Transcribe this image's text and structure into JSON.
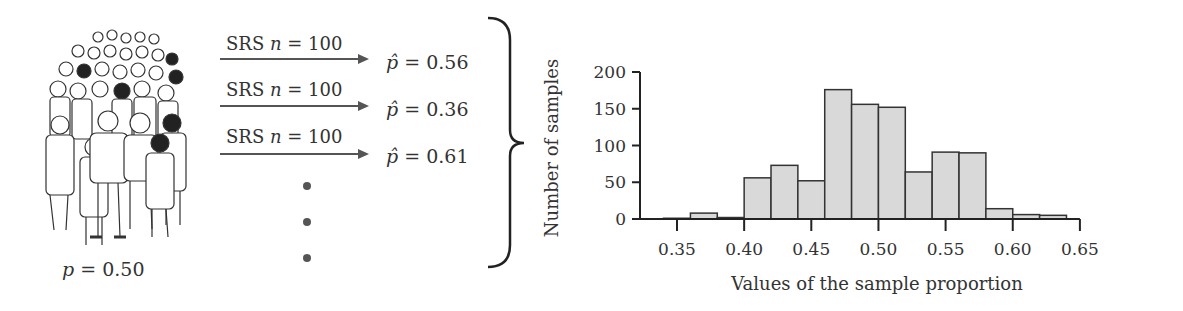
{
  "population": {
    "illustration": "crowd-of-people",
    "label_symbol": "p",
    "label_value": "= 0.50"
  },
  "samples": [
    {
      "label_prefix": "SRS",
      "label_n": "n",
      "label_value": "= 100",
      "phat_symbol": "p̂",
      "phat_value": "= 0.56"
    },
    {
      "label_prefix": "SRS",
      "label_n": "n",
      "label_value": "= 100",
      "phat_symbol": "p̂",
      "phat_value": "= 0.36"
    },
    {
      "label_prefix": "SRS",
      "label_n": "n",
      "label_value": "= 100",
      "phat_symbol": "p̂",
      "phat_value": "= 0.61"
    }
  ],
  "ellipsis": "vertical-dots",
  "chart_data": {
    "type": "bar",
    "subtype": "histogram",
    "title": "",
    "xlabel": "Values of the sample proportion",
    "ylabel": "Number of samples",
    "bin_width": 0.02,
    "bin_starts": [
      0.34,
      0.36,
      0.38,
      0.4,
      0.42,
      0.44,
      0.46,
      0.48,
      0.5,
      0.52,
      0.54,
      0.56,
      0.58,
      0.6,
      0.62
    ],
    "values": [
      1,
      8,
      2,
      56,
      73,
      52,
      176,
      156,
      152,
      64,
      91,
      90,
      14,
      6,
      5
    ],
    "xticks": [
      "0.35",
      "0.40",
      "0.45",
      "0.50",
      "0.55",
      "0.60",
      "0.65"
    ],
    "yticks": [
      "0",
      "50",
      "100",
      "150",
      "200"
    ],
    "xlim": [
      0.325,
      0.65
    ],
    "ylim": [
      0,
      200
    ],
    "grid": false,
    "bar_fill": "#d9d9d9",
    "bar_edge": "#333333"
  }
}
